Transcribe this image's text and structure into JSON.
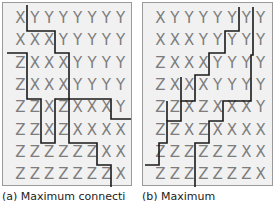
{
  "figure": {
    "panels": [
      {
        "id": "a",
        "caption": "(a) Maximum connecti",
        "grid": [
          [
            "X",
            "Y",
            "Y",
            "Y",
            "Y",
            "Y",
            "Y",
            "Y"
          ],
          [
            "X",
            "X",
            "X",
            "Y",
            "Y",
            "Y",
            "Y",
            "Y"
          ],
          [
            "Z",
            "X",
            "X",
            "X",
            "Y",
            "Y",
            "Y",
            "Y"
          ],
          [
            "Z",
            "X",
            "X",
            "X",
            "Y",
            "Y",
            "Y",
            "Y"
          ],
          [
            "Z",
            "Z",
            "X",
            "Z",
            "X",
            "X",
            "X",
            "Y"
          ],
          [
            "Z",
            "Z",
            "X",
            "Z",
            "X",
            "X",
            "X",
            "X"
          ],
          [
            "Z",
            "Z",
            "Z",
            "Z",
            "Z",
            "Z",
            "X",
            "X"
          ],
          [
            "Z",
            "Z",
            "Z",
            "Z",
            "Z",
            "Z",
            "Z",
            "X"
          ]
        ]
      },
      {
        "id": "b",
        "caption": "(b) Maximum",
        "grid": [
          [
            "X",
            "Y",
            "Y",
            "Y",
            "Y",
            "Y",
            "Y",
            "Y"
          ],
          [
            "X",
            "X",
            "X",
            "Y",
            "Y",
            "Y",
            "Y",
            "Y"
          ],
          [
            "Z",
            "X",
            "X",
            "X",
            "Y",
            "Y",
            "Y",
            "Y"
          ],
          [
            "Z",
            "X",
            "X",
            "X",
            "Y",
            "Y",
            "Y",
            "Y"
          ],
          [
            "Z",
            "Z",
            "X",
            "Z",
            "X",
            "X",
            "X",
            "Y"
          ],
          [
            "Z",
            "Z",
            "X",
            "Z",
            "X",
            "X",
            "X",
            "X"
          ],
          [
            "Z",
            "Z",
            "Z",
            "Z",
            "Z",
            "Z",
            "X",
            "X"
          ],
          [
            "Z",
            "Z",
            "Z",
            "Z",
            "Z",
            "Z",
            "Z",
            "X"
          ]
        ]
      }
    ],
    "colors": {
      "letters": "#7d7d7d",
      "lines": "#1a1a1a",
      "panel_bg": "#f1f1f1",
      "border": "#9a9a9a"
    }
  }
}
